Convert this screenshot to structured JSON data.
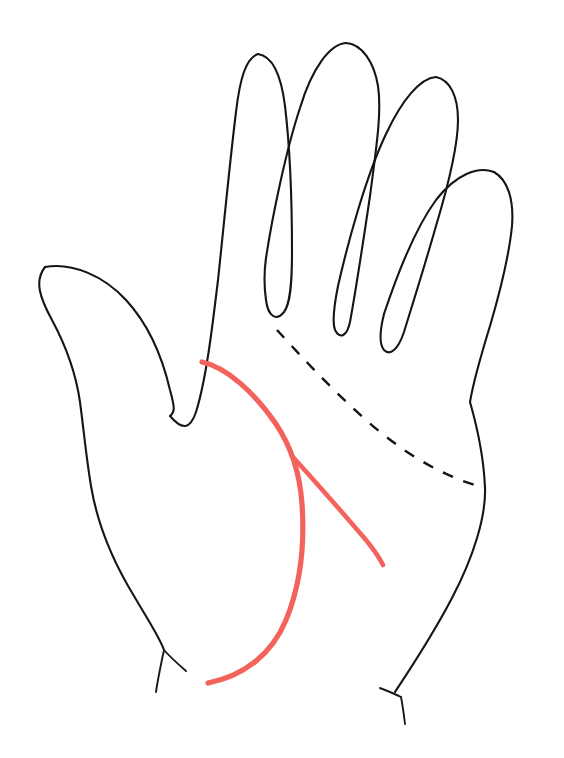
{
  "figure": {
    "background_color": "#ffffff",
    "ink_color": "#151515",
    "highlight_color": "#F4625C",
    "width": 564,
    "height": 758,
    "caption": "",
    "labels": []
  },
  "chart_data": {
    "type": "line",
    "xlabel": "",
    "ylabel": "",
    "xlim": [
      0,
      564
    ],
    "ylim": [
      0,
      758
    ],
    "grid": false,
    "legend": "none",
    "series": [
      {
        "name": "hand-outline",
        "style": "solid",
        "color": "#151515",
        "width": 2.1,
        "points": "M 45 267 C 34 281 40 298 52 320 C 66 346 76 374 80 402 C 84 432 86 456 91 486 C 97 522 112 560 134 596 C 148 620 160 638 164 650"
      },
      {
        "name": "thumb-upper-edge",
        "style": "solid",
        "color": "#151515",
        "width": 2.1,
        "points": "M 45 267 C 72 262 104 276 126 300 C 150 326 163 360 170 390 C 175 408 175 412 170 416"
      },
      {
        "name": "index-finger-left-edge",
        "style": "solid",
        "color": "#151515",
        "width": 2.1,
        "points": "M 170 416 C 182 430 190 430 196 412 C 206 380 212 330 218 280 C 224 224 230 160 236 112 C 240 78 246 58 258 54"
      },
      {
        "name": "index-finger-right-edge",
        "style": "solid",
        "color": "#151515",
        "width": 2.1,
        "points": "M 258 54 C 272 56 281 74 285 106 C 290 148 292 206 292 252 C 292 286 290 304 284 312 C 276 322 268 316 266 300 C 264 286 264 272 266 258"
      },
      {
        "name": "middle-finger-left-edge",
        "style": "solid",
        "color": "#151515",
        "width": 2.1,
        "points": "M 266 258 C 272 218 286 150 300 108 C 312 68 330 44 346 43"
      },
      {
        "name": "middle-finger-right-edge",
        "style": "solid",
        "color": "#151515",
        "width": 2.1,
        "points": "M 346 43 C 362 44 374 62 378 86 C 382 112 376 150 370 196 C 362 250 354 300 350 322 C 347 336 340 340 335 330 C 332 322 334 306 338 286"
      },
      {
        "name": "ring-finger-left-edge",
        "style": "solid",
        "color": "#151515",
        "width": 2.1,
        "points": "M 338 286 C 348 242 366 176 386 134 C 402 100 420 78 436 77"
      },
      {
        "name": "ring-finger-right-edge",
        "style": "solid",
        "color": "#151515",
        "width": 2.1,
        "points": "M 436 77 C 450 80 458 96 458 120 C 458 148 448 186 436 226 C 424 268 412 306 404 332 C 398 350 390 356 384 350 C 379 344 380 330 384 314"
      },
      {
        "name": "pinky-finger-left-edge",
        "style": "solid",
        "color": "#151515",
        "width": 2.1,
        "points": "M 384 314 C 396 278 414 230 436 200 C 456 174 478 166 494 172"
      },
      {
        "name": "pinky-finger-right-edge",
        "style": "solid",
        "color": "#151515",
        "width": 2.1,
        "points": "M 494 172 C 508 180 514 200 512 226 C 509 256 500 292 490 326 C 482 352 474 378 470 402"
      },
      {
        "name": "palm-right-edge",
        "style": "solid",
        "color": "#151515",
        "width": 2.1,
        "points": "M 470 402 C 478 430 484 462 485 488 C 486 516 474 556 452 598 C 430 640 408 672 395 692"
      },
      {
        "name": "wrist-tick-left",
        "style": "solid",
        "color": "#151515",
        "width": 1.9,
        "points": "M 164 650 C 161 664 158 678 156 692"
      },
      {
        "name": "wrist-edge-left-stub",
        "style": "solid",
        "color": "#151515",
        "width": 1.9,
        "points": "M 164 650 C 170 657 178 664 186 671"
      },
      {
        "name": "wrist-tick-right",
        "style": "solid",
        "color": "#151515",
        "width": 1.9,
        "points": "M 401 697 C 403 707 404 716 405 724"
      },
      {
        "name": "wrist-edge-right-stub",
        "style": "solid",
        "color": "#151515",
        "width": 1.9,
        "points": "M 401 697 C 393 693 385 690 380 688"
      },
      {
        "name": "heart-line-dashed",
        "style": "dashed",
        "color": "#141414",
        "width": 2.4,
        "dash_pattern": [
          11,
          11
        ],
        "points": "M 277 330 C 300 355 330 388 366 420 C 402 452 444 478 486 488"
      },
      {
        "name": "life-line-red",
        "style": "solid",
        "color": "#F4625C",
        "width": 5.2,
        "points": "M 202 362 C 226 367 254 392 276 424 C 292 448 300 474 302 504 C 305 546 300 586 286 620 C 272 654 244 676 208 683"
      },
      {
        "name": "head-line-branch-red",
        "style": "solid",
        "color": "#F4625C",
        "width": 4.6,
        "points": "M 292 456 C 312 478 342 512 366 540 C 375 551 380 559 383 565"
      }
    ],
    "annotations": [
      {
        "name": "thumb-tip",
        "x": 45,
        "y": 267
      },
      {
        "name": "index-finger-tip",
        "x": 258,
        "y": 54
      },
      {
        "name": "middle-finger-tip",
        "x": 346,
        "y": 43
      },
      {
        "name": "ring-finger-tip",
        "x": 436,
        "y": 77
      },
      {
        "name": "pinky-finger-tip",
        "x": 500,
        "y": 173
      },
      {
        "name": "thumb-index-notch",
        "x": 170,
        "y": 416
      },
      {
        "name": "life-line-start",
        "x": 202,
        "y": 362
      },
      {
        "name": "life-line-end",
        "x": 208,
        "y": 683
      },
      {
        "name": "branch-origin",
        "x": 294,
        "y": 458
      },
      {
        "name": "branch-end",
        "x": 383,
        "y": 565
      },
      {
        "name": "heart-line-start",
        "x": 277,
        "y": 330
      },
      {
        "name": "heart-line-end",
        "x": 486,
        "y": 488
      }
    ]
  }
}
